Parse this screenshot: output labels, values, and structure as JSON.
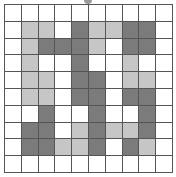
{
  "puzzle": {
    "rows": 10,
    "cols": 10,
    "colors": {
      "W": "#ffffff",
      "L": "#c6c6c6",
      "D": "#7b7b7b",
      "grid": "#555555"
    },
    "cells": [
      [
        "W",
        "W",
        "W",
        "W",
        "W",
        "W",
        "W",
        "W",
        "W",
        "W"
      ],
      [
        "W",
        "L",
        "L",
        "W",
        "D",
        "L",
        "L",
        "D",
        "D",
        "W"
      ],
      [
        "W",
        "L",
        "D",
        "D",
        "D",
        "L",
        "W",
        "D",
        "D",
        "W"
      ],
      [
        "W",
        "L",
        "W",
        "W",
        "D",
        "W",
        "W",
        "L",
        "W",
        "W"
      ],
      [
        "W",
        "L",
        "L",
        "W",
        "D",
        "D",
        "W",
        "L",
        "L",
        "W"
      ],
      [
        "W",
        "L",
        "L",
        "W",
        "D",
        "D",
        "W",
        "D",
        "D",
        "W"
      ],
      [
        "W",
        "W",
        "D",
        "W",
        "W",
        "D",
        "W",
        "W",
        "D",
        "W"
      ],
      [
        "W",
        "D",
        "D",
        "W",
        "L",
        "D",
        "L",
        "L",
        "D",
        "W"
      ],
      [
        "W",
        "D",
        "D",
        "L",
        "L",
        "D",
        "W",
        "D",
        "L",
        "W"
      ],
      [
        "W",
        "W",
        "W",
        "W",
        "W",
        "W",
        "W",
        "W",
        "W",
        "W"
      ]
    ]
  }
}
